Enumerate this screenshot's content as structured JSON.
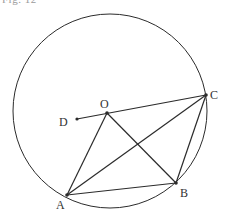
{
  "caption_fragment": "Fig. 12",
  "circle": {
    "cx": 110,
    "cy": 111,
    "r": 97
  },
  "points": {
    "O": {
      "x": 107,
      "y": 113,
      "label": "O",
      "lx": 100,
      "ly": 108
    },
    "C": {
      "x": 206,
      "y": 95,
      "label": "C",
      "lx": 210,
      "ly": 99
    },
    "A": {
      "x": 67,
      "y": 195,
      "label": "A",
      "lx": 56,
      "ly": 209
    },
    "B": {
      "x": 176,
      "y": 183,
      "label": "B",
      "lx": 180,
      "ly": 197
    },
    "D": {
      "x": 77,
      "y": 119,
      "label": "D",
      "lx": 59,
      "ly": 126
    }
  },
  "segments": [
    [
      "D",
      "C"
    ],
    [
      "O",
      "A"
    ],
    [
      "O",
      "B"
    ],
    [
      "A",
      "B"
    ],
    [
      "A",
      "C"
    ],
    [
      "B",
      "C"
    ]
  ],
  "colors": {
    "stroke": "#2b2b2b",
    "label": "#333333"
  }
}
